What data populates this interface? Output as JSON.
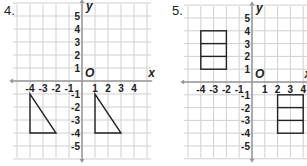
{
  "problems": [
    {
      "number": "4.",
      "origin_label": "O",
      "x_axis_label": "x",
      "y_axis_label": "y",
      "x_ticks": [
        "-4",
        "-3",
        "-2",
        "-1",
        "1",
        "2",
        "3",
        "4"
      ],
      "y_ticks": [
        "5",
        "4",
        "3",
        "2",
        "1",
        "-1",
        "-2",
        "-3",
        "-4",
        "-5"
      ],
      "shapes": [
        {
          "type": "triangle",
          "vertices": [
            [
              -4,
              -1
            ],
            [
              -4,
              -4
            ],
            [
              -2,
              -4
            ]
          ]
        },
        {
          "type": "triangle",
          "vertices": [
            [
              1,
              -1
            ],
            [
              1,
              -4
            ],
            [
              3,
              -4
            ]
          ]
        }
      ]
    },
    {
      "number": "5.",
      "origin_label": "O",
      "x_axis_label": "x",
      "y_axis_label": "y",
      "x_ticks": [
        "-4",
        "-3",
        "-2",
        "-1",
        "1",
        "2",
        "3",
        "4"
      ],
      "y_ticks": [
        "5",
        "4",
        "3",
        "2",
        "1",
        "-1",
        "-2",
        "-3",
        "-4",
        "-5"
      ],
      "shapes": [
        {
          "type": "rectangle",
          "corners": [
            [
              -4,
              1
            ],
            [
              -2,
              4
            ]
          ],
          "divisions_y": [
            2,
            3
          ]
        },
        {
          "type": "rectangle",
          "corners": [
            [
              2,
              -4
            ],
            [
              4,
              -1
            ]
          ],
          "divisions_y": [
            -2,
            -3
          ]
        }
      ]
    }
  ]
}
